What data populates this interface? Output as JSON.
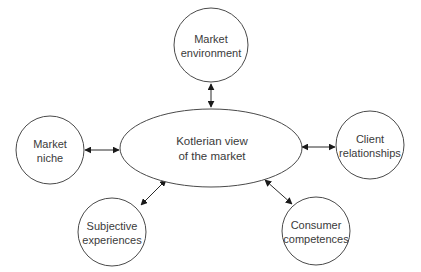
{
  "diagram": {
    "center": {
      "line1": "Kotlerian view",
      "line2": "of the market"
    },
    "nodes": {
      "market_environment": {
        "line1": "Market",
        "line2": "environment"
      },
      "market_niche": {
        "line1": "Market",
        "line2": "niche"
      },
      "client_relationships": {
        "line1": "Client",
        "line2": "relationships"
      },
      "subjective_experiences": {
        "line1": "Subjective",
        "line2": "experiences"
      },
      "consumer_competences": {
        "line1": "Consumer",
        "line2": "competences"
      }
    },
    "connectors": [
      {
        "from": "Kotlerian view of the market",
        "to": "Market environment",
        "type": "bidirectional-arrow"
      },
      {
        "from": "Kotlerian view of the market",
        "to": "Market niche",
        "type": "bidirectional-arrow"
      },
      {
        "from": "Kotlerian view of the market",
        "to": "Client relationships",
        "type": "bidirectional-arrow"
      },
      {
        "from": "Kotlerian view of the market",
        "to": "Subjective experiences",
        "type": "bidirectional-arrow"
      },
      {
        "from": "Kotlerian view of the market",
        "to": "Consumer competences",
        "type": "bidirectional-arrow"
      }
    ],
    "colors": {
      "stroke": "#4a4a4a",
      "text": "#3a3a3a",
      "background": "#ffffff"
    }
  }
}
